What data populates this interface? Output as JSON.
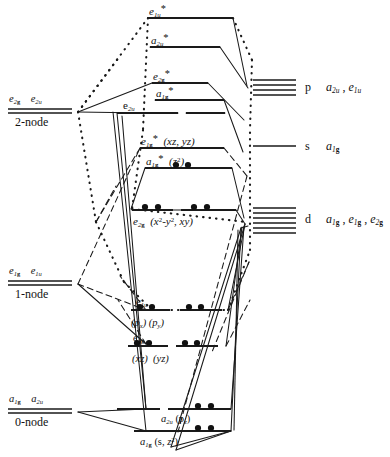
{
  "figure": {
    "type": "molecular-orbital-correlation-diagram"
  },
  "ligand_side": {
    "groups": [
      {
        "id": "two-node",
        "labels": [
          "e2g",
          "e2u"
        ],
        "node_text": "2-node",
        "line_count": 2
      },
      {
        "id": "one-node",
        "labels": [
          "e1g",
          "e1u"
        ],
        "node_text": "1-node",
        "line_count": 2
      },
      {
        "id": "zero-node",
        "labels": [
          "a1g",
          "a2u"
        ],
        "node_text": "0-node",
        "line_count": 2
      }
    ]
  },
  "metal_side": {
    "levels": [
      {
        "id": "p",
        "orbital": "p",
        "symmetries": "a2u , e1u",
        "line_count": 4
      },
      {
        "id": "s",
        "orbital": "s",
        "symmetries": "a1g",
        "line_count": 1
      },
      {
        "id": "d",
        "orbital": "d",
        "symmetries": "a1g , e1g , e2g",
        "line_count": 6
      }
    ]
  },
  "mo_levels": [
    {
      "id": "e1u-star",
      "label": "e1u*",
      "starred": true,
      "sublabel": "",
      "electrons": 0
    },
    {
      "id": "a2u-star",
      "label": "a2u*",
      "starred": true,
      "sublabel": "",
      "electrons": 0
    },
    {
      "id": "e2g-star",
      "label": "e2g*",
      "starred": true,
      "sublabel": "",
      "electrons": 0
    },
    {
      "id": "a1g-star",
      "label": "a1g*",
      "starred": true,
      "sublabel": "",
      "electrons": 0
    },
    {
      "id": "e2u",
      "label": "e2u",
      "starred": false,
      "sublabel": "",
      "electrons": 0
    },
    {
      "id": "e1g-star",
      "label": "e1g*",
      "starred": true,
      "sublabel": "(xz, yz)",
      "electrons": 0
    },
    {
      "id": "a1g-plus",
      "label": "a1g*",
      "starred": true,
      "sublabel": "(z2)",
      "electrons": 2
    },
    {
      "id": "e2g",
      "label": "e2g",
      "starred": false,
      "sublabel": "(x2-y2 , xy)",
      "electrons": 4
    },
    {
      "id": "e1u",
      "label": "e1u",
      "starred": false,
      "sublabel": "(px) (py)",
      "electrons": 4
    },
    {
      "id": "e1g",
      "label": "e1g",
      "starred": false,
      "sublabel": "(xz) (yz)",
      "electrons": 4
    },
    {
      "id": "a2u",
      "label": "a2u",
      "starred": false,
      "sublabel": "(pz)",
      "electrons": 2
    },
    {
      "id": "a1g",
      "label": "a1g",
      "starred": false,
      "sublabel": "(s, z2)",
      "electrons": 2
    }
  ],
  "colors": {
    "ink": "#1a1a1a",
    "background": "#ffffff"
  },
  "line_styles": [
    "solid",
    "dashed",
    "dotted"
  ]
}
